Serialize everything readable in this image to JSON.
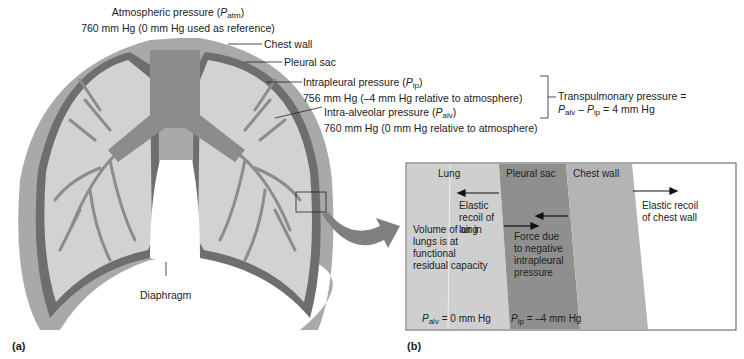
{
  "panel_a": {
    "label": "(a)",
    "atm_title": "Atmospheric pressure (",
    "atm_sym": "P",
    "atm_sub": "atm",
    "atm_close": ")",
    "atm_value": "760 mm Hg (0 mm Hg used as reference)",
    "chest_wall": "Chest wall",
    "pleural_sac": "Pleural sac",
    "ip_title": "Intrapleural pressure (",
    "ip_sym": "P",
    "ip_sub": "ip",
    "ip_close": ")",
    "ip_value": "756 mm Hg (–4 mm Hg relative to atmosphere)",
    "alv_title": "Intra-alveolar pressure (",
    "alv_sym": "P",
    "alv_sub": "alv",
    "alv_close": ")",
    "alv_value": "760 mm Hg (0 mm Hg relative to atmosphere)",
    "diaphragm": "Diaphragm",
    "transpulmonary_line1": "Transpulmonary pressure =",
    "tp_p1": "P",
    "tp_s1": "alv",
    "tp_minus": " – ",
    "tp_p2": "P",
    "tp_s2": "ip",
    "tp_eq": " = 4 mm Hg"
  },
  "panel_b": {
    "label": "(b)",
    "lung": "Lung",
    "pleural_sac": "Pleural sac",
    "chest_wall": "Chest wall",
    "elastic_lung": [
      "Elastic",
      "recoil of",
      "lung"
    ],
    "force_ip": [
      "Force due",
      "to negative",
      "intrapleural",
      "pressure"
    ],
    "elastic_chest": [
      "Elastic recoil",
      "of chest wall"
    ],
    "volume": [
      "Volume of air in",
      "lungs is at",
      "functional",
      "residual capacity"
    ],
    "palv_sym": "P",
    "palv_sub": "alv",
    "palv_val": " = 0 mm Hg",
    "pip_sym": "P",
    "pip_sub": "ip",
    "pip_val": " = –4 mm Hg"
  },
  "colors": {
    "chest_wall": "#a9a9a9",
    "pleural": "#6e6e6e",
    "lung_fill": "#d2d2d2",
    "airway": "#8c8c8c",
    "lung_b": "#cfcfcf",
    "pleural_b": "#8f8f8f",
    "chest_b": "#b4b4b4"
  }
}
